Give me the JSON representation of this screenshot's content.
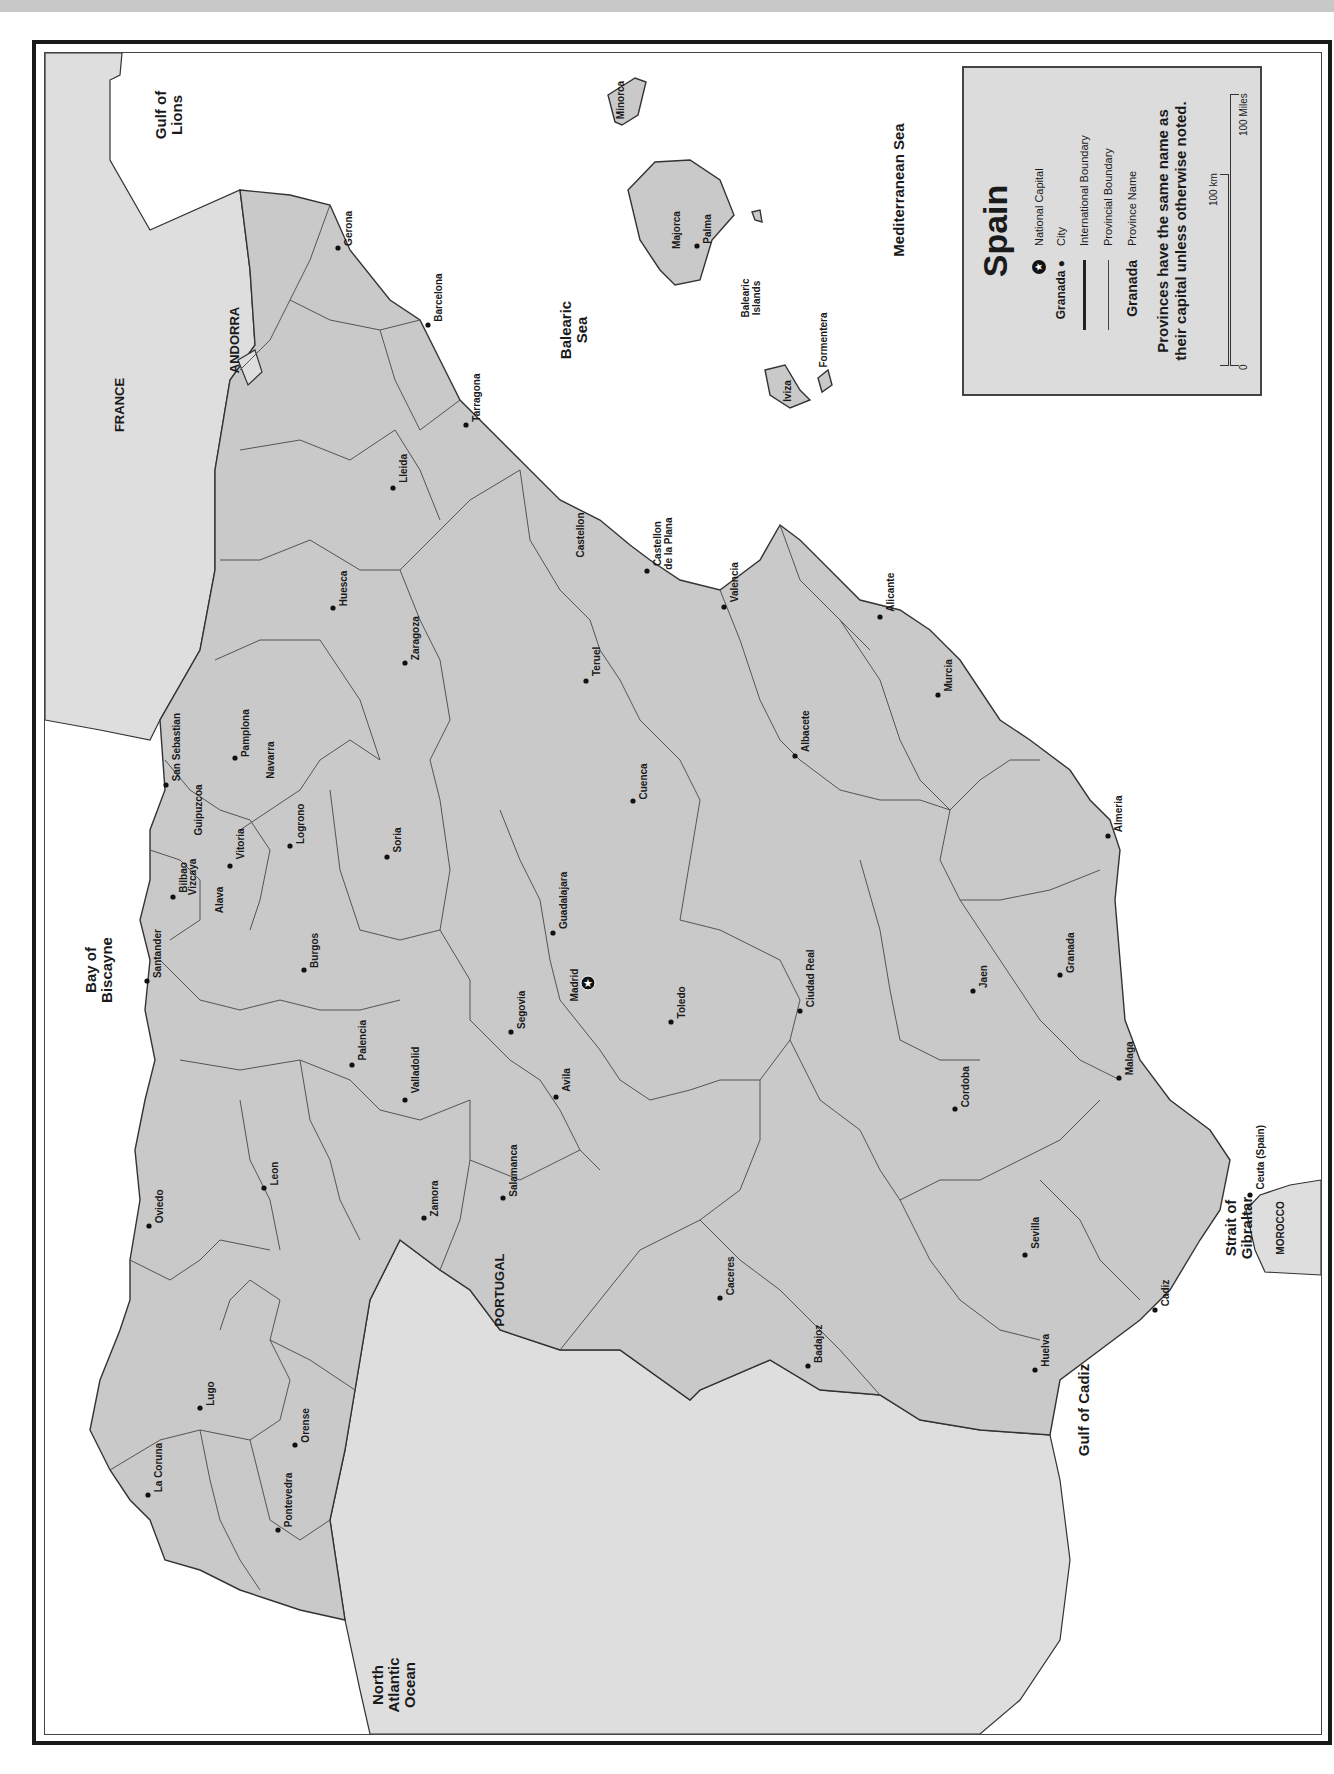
{
  "map": {
    "title": "Spain",
    "orientation": "rotated 90 degrees clockwise (north to the left)",
    "colors": {
      "spain_fill": "#c9c9c9",
      "neighbor_fill": "#dedede",
      "water": "#ffffff",
      "border": "#333333"
    }
  },
  "legend": {
    "title": "Spain",
    "items": [
      {
        "symbol": "star-in-circle",
        "symbol_label": "",
        "label": "National Capital"
      },
      {
        "symbol": "dot",
        "symbol_label": "Granada",
        "label": "City"
      },
      {
        "symbol": "thick-line",
        "symbol_label": "",
        "label": "International Boundary"
      },
      {
        "symbol": "thin-line",
        "symbol_label": "",
        "label": "Provincial Boundary"
      },
      {
        "symbol": "text",
        "symbol_label": "Granada",
        "label": "Province Name"
      }
    ],
    "note_line1": "Provinces have the same name as",
    "note_line2": "their capital unless otherwise noted.",
    "scale": {
      "zero": "0",
      "km": "100 km",
      "miles": "100 Miles"
    }
  },
  "countries": [
    {
      "name": "FRANCE",
      "x": 120,
      "y": 405
    },
    {
      "name": "ANDORRA",
      "x": 235,
      "y": 340
    },
    {
      "name": "PORTUGAL",
      "x": 500,
      "y": 1290
    },
    {
      "name": "MOROCCO",
      "x": 1280,
      "y": 1228,
      "small": true
    }
  ],
  "water_bodies": [
    {
      "name": "Gulf of\nLions",
      "x": 170,
      "y": 115
    },
    {
      "name": "Balearic\nSea",
      "x": 575,
      "y": 330
    },
    {
      "name": "Mediterranean Sea",
      "x": 900,
      "y": 190
    },
    {
      "name": "Bay of\nBiscayne",
      "x": 100,
      "y": 970
    },
    {
      "name": "North\nAtlantic\nOcean",
      "x": 395,
      "y": 1685
    },
    {
      "name": "Gulf of Cadiz",
      "x": 1085,
      "y": 1410
    },
    {
      "name": "Strait of\nGibraltar",
      "x": 1240,
      "y": 1228
    },
    {
      "name": "Balearic\nIslands",
      "x": 750,
      "y": 298,
      "small": true
    }
  ],
  "capital": {
    "name": "Madrid",
    "x": 588,
    "y": 983
  },
  "cities": [
    {
      "name": "Gerona",
      "x": 338,
      "y": 248
    },
    {
      "name": "Barcelona",
      "x": 428,
      "y": 325
    },
    {
      "name": "Lleida",
      "x": 393,
      "y": 488
    },
    {
      "name": "Tarragona",
      "x": 466,
      "y": 425
    },
    {
      "name": "Huesca",
      "x": 333,
      "y": 608
    },
    {
      "name": "Zaragoza",
      "x": 405,
      "y": 663
    },
    {
      "name": "Pamplona",
      "x": 235,
      "y": 758
    },
    {
      "name": "San Sebastian",
      "x": 166,
      "y": 785
    },
    {
      "name": "Bilbao",
      "x": 173,
      "y": 897
    },
    {
      "name": "Vitoria",
      "x": 230,
      "y": 866
    },
    {
      "name": "Logrono",
      "x": 290,
      "y": 846
    },
    {
      "name": "Soria",
      "x": 387,
      "y": 857
    },
    {
      "name": "Santander",
      "x": 147,
      "y": 981
    },
    {
      "name": "Burgos",
      "x": 304,
      "y": 970
    },
    {
      "name": "Guadalajara",
      "x": 553,
      "y": 933
    },
    {
      "name": "Teruel",
      "x": 586,
      "y": 681
    },
    {
      "name": "Castellon\nde la Plana",
      "x": 647,
      "y": 571
    },
    {
      "name": "Valencia",
      "x": 724,
      "y": 607
    },
    {
      "name": "Cuenca",
      "x": 633,
      "y": 801
    },
    {
      "name": "Alicante",
      "x": 880,
      "y": 617
    },
    {
      "name": "Murcia",
      "x": 938,
      "y": 695
    },
    {
      "name": "Albacete",
      "x": 795,
      "y": 756
    },
    {
      "name": "Almeria",
      "x": 1108,
      "y": 836
    },
    {
      "name": "Granada",
      "x": 1060,
      "y": 975
    },
    {
      "name": "Jaen",
      "x": 973,
      "y": 991
    },
    {
      "name": "Ciudad Real",
      "x": 800,
      "y": 1011
    },
    {
      "name": "Toledo",
      "x": 671,
      "y": 1022
    },
    {
      "name": "Segovia",
      "x": 511,
      "y": 1032
    },
    {
      "name": "Valladolid",
      "x": 405,
      "y": 1100
    },
    {
      "name": "Palencia",
      "x": 352,
      "y": 1065
    },
    {
      "name": "Avila",
      "x": 556,
      "y": 1097
    },
    {
      "name": "Malaga",
      "x": 1119,
      "y": 1078
    },
    {
      "name": "Cordoba",
      "x": 955,
      "y": 1109
    },
    {
      "name": "Leon",
      "x": 264,
      "y": 1188
    },
    {
      "name": "Oviedo",
      "x": 149,
      "y": 1226
    },
    {
      "name": "Zamora",
      "x": 424,
      "y": 1218
    },
    {
      "name": "Salamanca",
      "x": 503,
      "y": 1198
    },
    {
      "name": "Sevilla",
      "x": 1025,
      "y": 1255
    },
    {
      "name": "Caceres",
      "x": 720,
      "y": 1298
    },
    {
      "name": "Cadiz",
      "x": 1155,
      "y": 1310
    },
    {
      "name": "Badajoz",
      "x": 808,
      "y": 1366
    },
    {
      "name": "Huelva",
      "x": 1035,
      "y": 1370
    },
    {
      "name": "Lugo",
      "x": 200,
      "y": 1408
    },
    {
      "name": "Orense",
      "x": 295,
      "y": 1445
    },
    {
      "name": "La Coruna",
      "x": 148,
      "y": 1495
    },
    {
      "name": "Pontevedra",
      "x": 278,
      "y": 1530
    },
    {
      "name": "Palma",
      "x": 697,
      "y": 246
    },
    {
      "name": "Ceuta (Spain)",
      "x": 1250,
      "y": 1195
    }
  ],
  "provinces": [
    {
      "name": "Navarra",
      "x": 270,
      "y": 760
    },
    {
      "name": "Guipuzcoa",
      "x": 198,
      "y": 810
    },
    {
      "name": "Vizcaya",
      "x": 192,
      "y": 877
    },
    {
      "name": "Alava",
      "x": 219,
      "y": 900
    },
    {
      "name": "Castellon",
      "x": 580,
      "y": 535
    },
    {
      "name": "Minorca",
      "x": 620,
      "y": 100
    },
    {
      "name": "Majorca",
      "x": 676,
      "y": 230
    },
    {
      "name": "Iviza",
      "x": 787,
      "y": 391
    },
    {
      "name": "Formentera",
      "x": 823,
      "y": 340
    }
  ]
}
